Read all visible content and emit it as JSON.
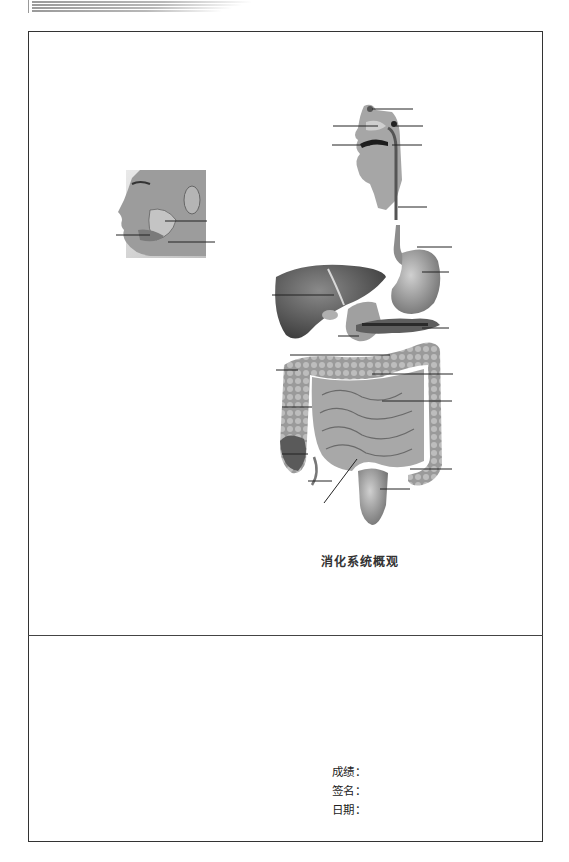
{
  "document": {
    "figure_caption": "消化系统概观",
    "diagram_labels": {
      "face_salivary_glands": {
        "label_count": 3
      },
      "head_section": {
        "label_count": 5
      },
      "abdominal_organs": {
        "label_count": 15
      }
    },
    "grading": {
      "score_label": "成绩",
      "signature_label": "签名",
      "date_label": "日期",
      "separator": "："
    }
  }
}
